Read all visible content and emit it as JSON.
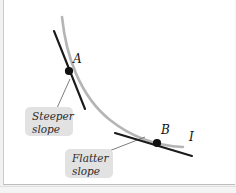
{
  "figure": {
    "background_color": "#ffffff",
    "frame_color": "#c9c9c9",
    "curve_color": "#b5b5b5",
    "tangent_color": "#1a1a1a",
    "point_color": "#111111",
    "callout_bg": "#e2e2e2",
    "callout_text_color": "#2b2b2b"
  },
  "curve": {
    "name": "I",
    "label": "I",
    "label_x": 189,
    "label_y": 131,
    "stroke_width": 2.6,
    "path": "M 62 17 C 66 56, 80 96, 110 120 C 134 139, 160 146, 183 147"
  },
  "points": [
    {
      "id": "A",
      "label": "A",
      "x": 69,
      "y": 71,
      "radius": 4.1,
      "label_x": 73,
      "label_y": 53,
      "slope_description": "Steeper slope"
    },
    {
      "id": "B",
      "label": "B",
      "x": 157,
      "y": 143,
      "radius": 4.1,
      "label_x": 161,
      "label_y": 124,
      "slope_description": "Flatter slope"
    }
  ],
  "tangents": [
    {
      "id": "tangent-a",
      "at_point": "A",
      "x1": 54,
      "y1": 31,
      "x2": 85,
      "y2": 109,
      "stroke_width": 2.1
    },
    {
      "id": "tangent-b",
      "at_point": "B",
      "x1": 115,
      "y1": 133,
      "x2": 192,
      "y2": 156,
      "stroke_width": 2.1
    }
  ],
  "callouts": [
    {
      "id": "steeper",
      "line1": "Steeper",
      "line2": "slope",
      "text": "Steeper\nslope",
      "box_x": 25,
      "box_y": 107,
      "box_w": 48,
      "box_h": 29,
      "leader": {
        "x1": 57,
        "y1": 108,
        "x2": 70,
        "y2": 79
      }
    },
    {
      "id": "flatter",
      "line1": "Flatter",
      "line2": "slope",
      "text": "Flatter\nslope",
      "box_x": 65,
      "box_y": 149,
      "box_w": 48,
      "box_h": 29,
      "leader": {
        "x1": 104,
        "y1": 153,
        "x2": 145,
        "y2": 137
      }
    }
  ]
}
